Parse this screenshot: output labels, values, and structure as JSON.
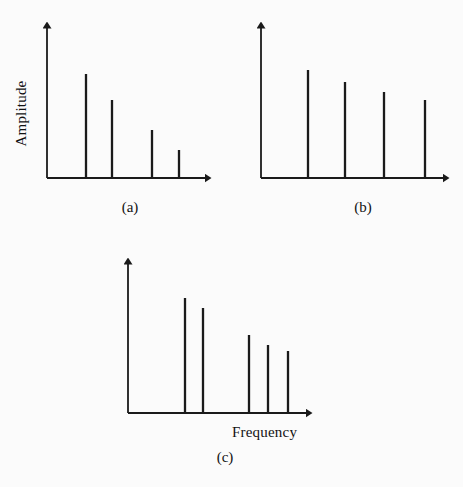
{
  "figure": {
    "background_color": "#fbfbfb",
    "stroke_color": "#1a1a1a",
    "axis_label_y": "Amplitude",
    "axis_label_x": "Frequency",
    "captions": {
      "a": "(a)",
      "b": "(b)",
      "c": "(c)"
    }
  },
  "chart_data": [
    {
      "type": "bar",
      "panel": "(a)",
      "title": "",
      "xlabel": "",
      "ylabel": "Amplitude",
      "grid": false,
      "legend": null,
      "axis_arrows": true,
      "origin_px": [
        47,
        178
      ],
      "xlim_px": [
        47,
        212
      ],
      "ylim_px": [
        178,
        22
      ],
      "categories": [
        "f1",
        "f2",
        "f3",
        "f4"
      ],
      "x_px": [
        86,
        112,
        152,
        179
      ],
      "values": [
        104,
        78,
        48,
        28
      ],
      "values_normalized": [
        1.0,
        0.75,
        0.46,
        0.27
      ]
    },
    {
      "type": "bar",
      "panel": "(b)",
      "title": "",
      "xlabel": "",
      "ylabel": "",
      "grid": false,
      "legend": null,
      "axis_arrows": true,
      "origin_px": [
        261,
        178
      ],
      "xlim_px": [
        261,
        450
      ],
      "ylim_px": [
        178,
        22
      ],
      "categories": [
        "f1",
        "f2",
        "f3",
        "f4"
      ],
      "x_px": [
        308,
        345,
        384,
        425
      ],
      "values": [
        108,
        96,
        86,
        78
      ],
      "values_normalized": [
        1.0,
        0.89,
        0.8,
        0.72
      ]
    },
    {
      "type": "bar",
      "panel": "(c)",
      "title": "",
      "xlabel": "Frequency",
      "ylabel": "",
      "grid": false,
      "legend": null,
      "axis_arrows": true,
      "origin_px": [
        128,
        413
      ],
      "xlim_px": [
        128,
        313
      ],
      "ylim_px": [
        413,
        258
      ],
      "categories": [
        "f1",
        "f2",
        "f3",
        "f4",
        "f5"
      ],
      "x_px": [
        185,
        203,
        249,
        268,
        288
      ],
      "values": [
        115,
        105,
        78,
        68,
        62
      ],
      "values_normalized": [
        1.0,
        0.91,
        0.68,
        0.59,
        0.54
      ]
    }
  ]
}
